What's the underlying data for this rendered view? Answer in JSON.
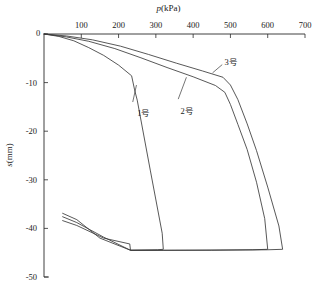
{
  "chart_data": {
    "type": "line",
    "title": "",
    "xlabel": "p(kPa)",
    "xlabel_symbol": "p",
    "xlabel_unit": "(kPa)",
    "ylabel": "s(mm)",
    "ylabel_symbol": "s",
    "ylabel_unit": "(mm)",
    "x_axis_position": "top",
    "y_axis_position": "left",
    "xlim": [
      0,
      700
    ],
    "ylim": [
      -50,
      0
    ],
    "xticks": [
      0,
      100,
      200,
      300,
      400,
      500,
      600,
      700
    ],
    "xtick_labels": [
      "0",
      "100",
      "200",
      "300",
      "400",
      "500",
      "600",
      "700"
    ],
    "yticks": [
      0,
      -10,
      -20,
      -30,
      -40,
      -50
    ],
    "ytick_labels": [
      "0",
      "-10",
      "-20",
      "-30",
      "-40",
      "-50"
    ],
    "grid": false,
    "legend_position": "inline-annotations",
    "series": [
      {
        "name": "1号",
        "label": "1号",
        "color": "#3a3a3a",
        "points": [
          [
            0,
            0
          ],
          [
            40,
            -0.5
          ],
          [
            80,
            -1.4
          ],
          [
            120,
            -2.8
          ],
          [
            160,
            -4.4
          ],
          [
            200,
            -6.4
          ],
          [
            235,
            -8.6
          ],
          [
            243,
            -11.5
          ],
          [
            250,
            -13.6
          ],
          [
            285,
            -28.0
          ],
          [
            317,
            -41.0
          ],
          [
            320,
            -44.3
          ],
          [
            305,
            -44.4
          ],
          [
            232,
            -44.5
          ],
          [
            230,
            -43.2
          ],
          [
            160,
            -42.0
          ],
          [
            88,
            -39.4
          ],
          [
            50,
            -38.4
          ]
        ],
        "label_position": [
          250,
          -15.5
        ],
        "leader_from": [
          238,
          -14.0
        ],
        "leader_to": [
          248,
          -10.5
        ]
      },
      {
        "name": "2号",
        "label": "2号",
        "color": "#3a3a3a",
        "points": [
          [
            0,
            0
          ],
          [
            60,
            -0.6
          ],
          [
            120,
            -1.5
          ],
          [
            190,
            -3.0
          ],
          [
            260,
            -4.9
          ],
          [
            330,
            -6.9
          ],
          [
            400,
            -8.8
          ],
          [
            460,
            -10.6
          ],
          [
            485,
            -12.0
          ],
          [
            500,
            -14.5
          ],
          [
            520,
            -18.6
          ],
          [
            545,
            -23.8
          ],
          [
            570,
            -30.5
          ],
          [
            592,
            -38.0
          ],
          [
            600,
            -44.3
          ],
          [
            560,
            -44.4
          ],
          [
            330,
            -44.5
          ],
          [
            232,
            -44.5
          ],
          [
            160,
            -41.8
          ],
          [
            88,
            -38.8
          ],
          [
            50,
            -37.6
          ]
        ],
        "label_position": [
          366,
          -15.0
        ],
        "leader_from": [
          360,
          -13.4
        ],
        "leader_to": [
          382,
          -8.9
        ]
      },
      {
        "name": "3号",
        "label": "3号",
        "color": "#3a3a3a",
        "points": [
          [
            0,
            0
          ],
          [
            60,
            -0.4
          ],
          [
            130,
            -1.2
          ],
          [
            205,
            -2.5
          ],
          [
            280,
            -4.2
          ],
          [
            355,
            -6.0
          ],
          [
            425,
            -7.6
          ],
          [
            480,
            -8.9
          ],
          [
            500,
            -10.5
          ],
          [
            520,
            -13.5
          ],
          [
            545,
            -18.5
          ],
          [
            570,
            -24.0
          ],
          [
            600,
            -31.5
          ],
          [
            630,
            -39.5
          ],
          [
            640,
            -44.3
          ],
          [
            600,
            -44.4
          ],
          [
            450,
            -44.5
          ],
          [
            320,
            -44.5
          ],
          [
            232,
            -44.5
          ],
          [
            150,
            -42.0
          ],
          [
            88,
            -38.2
          ],
          [
            50,
            -36.9
          ]
        ],
        "label_position": [
          484,
          -5.0
        ],
        "leader_from": [
          478,
          -6.3
        ],
        "leader_to": [
          452,
          -8.0
        ]
      }
    ],
    "annotations": [
      {
        "text": "1号",
        "x": 250,
        "y": -15.5
      },
      {
        "text": "2号",
        "x": 366,
        "y": -15.0
      },
      {
        "text": "3号",
        "x": 484,
        "y": -5.0
      }
    ]
  }
}
